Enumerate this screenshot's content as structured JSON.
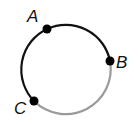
{
  "diagram": {
    "type": "circle-with-points",
    "circle": {
      "cx": 67,
      "cy": 70,
      "r": 45
    },
    "colors": {
      "dark_arc": "#111111",
      "light_arc": "#9a9a9a",
      "point": "#000000"
    },
    "points": [
      {
        "label": "A",
        "x": 47,
        "y": 29,
        "label_x": 27,
        "label_y": 22
      },
      {
        "label": "B",
        "x": 110,
        "y": 61,
        "label_x": 116,
        "label_y": 68
      },
      {
        "label": "C",
        "x": 34,
        "y": 101,
        "label_x": 14,
        "label_y": 114
      }
    ],
    "arcs": [
      {
        "from": "A",
        "to": "B",
        "color": "dark"
      },
      {
        "from": "B",
        "to": "C",
        "color": "light"
      },
      {
        "from": "C",
        "to": "A",
        "color": "dark"
      }
    ]
  }
}
